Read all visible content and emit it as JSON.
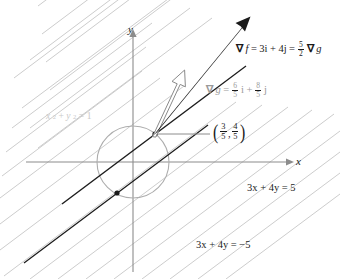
{
  "figure": {
    "background": "#ffffff"
  },
  "axes": {
    "x_label": "x",
    "y_label": "y",
    "color": "#8c8c8c",
    "origin": {
      "x": 133,
      "y": 162
    }
  },
  "circle": {
    "label": "x² + y² = 1",
    "label_parts": {
      "x": "x",
      "sup1": "2",
      "plus": "+",
      "y": "y",
      "sup2": "2",
      "eq": "=",
      "one": "1"
    },
    "color": "#b0b0b0",
    "center": {
      "x": 133,
      "y": 162
    },
    "radius": 36
  },
  "level_lines": {
    "family_color": "#c2c2c2",
    "highlight_color": "#1a1a1a",
    "slope_note": "3x + 4y = c"
  },
  "tangent_lines": [
    {
      "name": "upper-tangent-line",
      "label": "3x + 4y = 5",
      "value": 5
    },
    {
      "name": "lower-tangent-line",
      "label": "3x + 4y = −5",
      "value": -5
    }
  ],
  "tangent_points": [
    {
      "name": "upper-tangent-point",
      "x": 155,
      "y": 134
    },
    {
      "name": "lower-tangent-point",
      "x": 117,
      "y": 193
    }
  ],
  "point_label": {
    "open_paren": "(",
    "close_paren": ")",
    "x_num": "3",
    "x_den": "5",
    "comma": ",",
    "y_num": "4",
    "y_den": "5"
  },
  "gradient_f": {
    "name": "gradient-f-vector",
    "nabla": "∇",
    "f": "f",
    "eq1": "=",
    "term1": "3i",
    "plus": "+",
    "term2": "4j",
    "eq2": "=",
    "coef_num": "5",
    "coef_den": "2",
    "nabla2": "∇",
    "g": "g",
    "style": "solid-filled-arrow",
    "color": "#1a1a1a"
  },
  "gradient_g": {
    "name": "gradient-g-vector",
    "nabla": "∇",
    "g": "g",
    "eq": "=",
    "t1_num": "6",
    "t1_den": "5",
    "i": "i",
    "plus": "+",
    "t2_num": "8",
    "t2_den": "5",
    "j": "j",
    "style": "hollow-outline-arrow",
    "color": "#8a8a8a"
  },
  "leader_line": {
    "name": "point-leader-line",
    "color": "#8c8c8c"
  }
}
